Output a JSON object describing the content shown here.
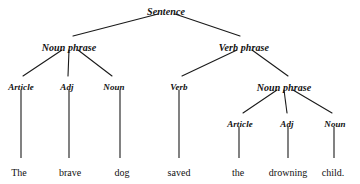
{
  "diagram": {
    "type": "syntax-tree",
    "sentence": "The brave dog saved the drowning child.",
    "width": 360,
    "height": 184,
    "background_color": "#ffffff",
    "line_color": "#1a1a1a",
    "text_color": "#111111"
  },
  "nodes": {
    "root": {
      "label": "Sentence",
      "x": 166,
      "y": 7,
      "font_size": 10
    },
    "np_left": {
      "label": "Noun phrase",
      "x": 69,
      "y": 43,
      "font_size": 10
    },
    "vp": {
      "label": "Verb phrase",
      "x": 244,
      "y": 43,
      "font_size": 10
    },
    "article_left": {
      "label": "Article",
      "x": 21,
      "y": 83,
      "font_size": 9
    },
    "adj_left": {
      "label": "Adj",
      "x": 67,
      "y": 83,
      "font_size": 9
    },
    "noun_left": {
      "label": "Noun",
      "x": 114,
      "y": 83,
      "font_size": 9
    },
    "verb": {
      "label": "Verb",
      "x": 179,
      "y": 83,
      "font_size": 9
    },
    "np_right": {
      "label": "Noun phrase",
      "x": 284,
      "y": 83,
      "font_size": 10
    },
    "article_right": {
      "label": "Article",
      "x": 240,
      "y": 120,
      "font_size": 9
    },
    "adj_right": {
      "label": "Adj",
      "x": 287,
      "y": 120,
      "font_size": 9
    },
    "noun_right": {
      "label": "Noun",
      "x": 335,
      "y": 120,
      "font_size": 9
    }
  },
  "words": [
    {
      "text": "The",
      "x": 19,
      "y": 168,
      "font_size": 10
    },
    {
      "text": "brave",
      "x": 70,
      "y": 168,
      "font_size": 10
    },
    {
      "text": "dog",
      "x": 122,
      "y": 168,
      "font_size": 10
    },
    {
      "text": "saved",
      "x": 179,
      "y": 168,
      "font_size": 10
    },
    {
      "text": "the",
      "x": 238,
      "y": 168,
      "font_size": 10
    },
    {
      "text": "drowning",
      "x": 288,
      "y": 168,
      "font_size": 10
    },
    {
      "text": "child.",
      "x": 333,
      "y": 168,
      "font_size": 10
    }
  ],
  "edges": [
    {
      "name": "root-to-noun-phrase",
      "x1": 158,
      "y1": 14,
      "x2": 73,
      "y2": 36
    },
    {
      "name": "root-to-verb-phrase",
      "x1": 175,
      "y1": 14,
      "x2": 240,
      "y2": 36
    },
    {
      "name": "np-left-to-article",
      "x1": 62,
      "y1": 50,
      "x2": 23,
      "y2": 76
    },
    {
      "name": "np-left-to-adj",
      "x1": 69,
      "y1": 50,
      "x2": 68,
      "y2": 76
    },
    {
      "name": "np-left-to-noun",
      "x1": 78,
      "y1": 50,
      "x2": 112,
      "y2": 76
    },
    {
      "name": "vp-to-verb",
      "x1": 237,
      "y1": 50,
      "x2": 182,
      "y2": 76
    },
    {
      "name": "vp-to-noun-phrase",
      "x1": 252,
      "y1": 50,
      "x2": 288,
      "y2": 76
    },
    {
      "name": "np-right-to-article",
      "x1": 277,
      "y1": 90,
      "x2": 243,
      "y2": 113
    },
    {
      "name": "np-right-to-adj",
      "x1": 284,
      "y1": 90,
      "x2": 287,
      "y2": 113
    },
    {
      "name": "np-right-to-noun",
      "x1": 293,
      "y1": 90,
      "x2": 332,
      "y2": 113
    }
  ],
  "stems": [
    {
      "name": "article-left-to-the",
      "x1": 21,
      "y1": 90,
      "x2": 21,
      "y2": 158
    },
    {
      "name": "adj-left-to-brave",
      "x1": 69,
      "y1": 90,
      "x2": 69,
      "y2": 158
    },
    {
      "name": "noun-left-to-dog",
      "x1": 120,
      "y1": 90,
      "x2": 120,
      "y2": 158
    },
    {
      "name": "verb-to-saved",
      "x1": 179,
      "y1": 90,
      "x2": 179,
      "y2": 158
    },
    {
      "name": "article-right-to-the",
      "x1": 239,
      "y1": 127,
      "x2": 239,
      "y2": 158
    },
    {
      "name": "adj-right-to-drowning",
      "x1": 288,
      "y1": 127,
      "x2": 288,
      "y2": 158
    },
    {
      "name": "noun-right-to-child",
      "x1": 334,
      "y1": 127,
      "x2": 334,
      "y2": 158
    }
  ]
}
